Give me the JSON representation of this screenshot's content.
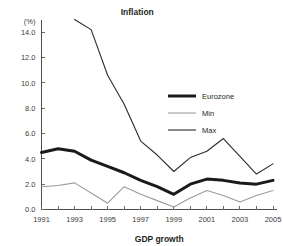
{
  "chart_data": {
    "type": "line",
    "title": "Inflation",
    "xlabel": "GDP growth",
    "ylabel": "(%)",
    "grid": false,
    "legend_position": "inside-right",
    "x": [
      1991,
      1992,
      1993,
      1994,
      1995,
      1996,
      1997,
      1998,
      1999,
      2000,
      2001,
      2002,
      2003,
      2004,
      2005
    ],
    "xtick_labels": [
      "1991",
      "1993",
      "1995",
      "1997",
      "1999",
      "2001",
      "2003",
      "2005"
    ],
    "xtick_values": [
      1991,
      1993,
      1995,
      1997,
      1999,
      2001,
      2003,
      2005
    ],
    "xlim": [
      1991,
      2005
    ],
    "ytick_labels": [
      "0.0",
      "2.0",
      "4.0",
      "6.0",
      "8.0",
      "10.0",
      "12.0",
      "14.0"
    ],
    "ytick_values": [
      0,
      2,
      4,
      6,
      8,
      10,
      12,
      14
    ],
    "ylim": [
      0,
      14.8
    ],
    "series": [
      {
        "name": "Eurozone",
        "color": "#1a1a1a",
        "width": 3.0,
        "values": [
          4.5,
          4.8,
          4.6,
          3.9,
          3.4,
          2.9,
          2.3,
          1.8,
          1.2,
          2.0,
          2.4,
          2.3,
          2.1,
          2.0,
          2.3
        ]
      },
      {
        "name": "Min",
        "color": "#9b9b9b",
        "width": 1.1,
        "values": [
          1.8,
          1.9,
          2.1,
          1.3,
          0.5,
          1.8,
          1.2,
          0.7,
          0.2,
          0.9,
          1.5,
          1.1,
          0.6,
          1.1,
          1.5
        ]
      },
      {
        "name": "Max",
        "color": "#2b2b2b",
        "width": 1.1,
        "values": [
          null,
          null,
          15.0,
          14.2,
          10.6,
          8.3,
          5.4,
          4.3,
          3.0,
          4.1,
          4.6,
          5.6,
          4.2,
          2.8,
          3.6
        ]
      }
    ]
  },
  "legend": {
    "items": [
      {
        "label": "Eurozone"
      },
      {
        "label": "Min"
      },
      {
        "label": "Max"
      }
    ]
  }
}
